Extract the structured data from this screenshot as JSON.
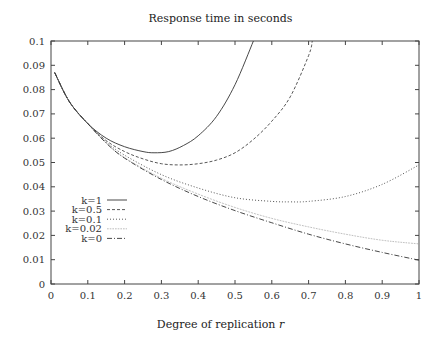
{
  "chart_data": {
    "type": "line",
    "title": "Response time in seconds",
    "xlabel": "Degree of replication r",
    "ylabel": "",
    "xlim": [
      0,
      1
    ],
    "ylim": [
      0,
      0.1
    ],
    "xticks": [
      "0",
      "0.1",
      "0.2",
      "0.3",
      "0.4",
      "0.5",
      "0.6",
      "0.7",
      "0.8",
      "0.9",
      "1"
    ],
    "yticks": [
      "0",
      "0.01",
      "0.02",
      "0.03",
      "0.04",
      "0.05",
      "0.06",
      "0.07",
      "0.08",
      "0.09",
      "0.1"
    ],
    "grid": false,
    "legend_position": "inside left, lower-middle",
    "series": [
      {
        "name": "k=1",
        "style": "solid",
        "x": [
          0.01,
          0.05,
          0.1,
          0.15,
          0.2,
          0.25,
          0.28,
          0.32,
          0.36,
          0.4,
          0.45,
          0.5,
          0.55
        ],
        "y": [
          0.087,
          0.075,
          0.066,
          0.06,
          0.0565,
          0.0545,
          0.054,
          0.0545,
          0.057,
          0.061,
          0.069,
          0.082,
          0.1
        ]
      },
      {
        "name": "k=0.5",
        "style": "dashed",
        "x": [
          0.01,
          0.05,
          0.1,
          0.15,
          0.2,
          0.25,
          0.3,
          0.35,
          0.4,
          0.45,
          0.5,
          0.55,
          0.6,
          0.65,
          0.7,
          0.71
        ],
        "y": [
          0.087,
          0.075,
          0.066,
          0.059,
          0.0545,
          0.0515,
          0.0495,
          0.049,
          0.0495,
          0.051,
          0.054,
          0.0595,
          0.067,
          0.077,
          0.094,
          0.1
        ]
      },
      {
        "name": "k=0.1",
        "style": "dotted",
        "x": [
          0.01,
          0.05,
          0.1,
          0.15,
          0.2,
          0.3,
          0.4,
          0.5,
          0.6,
          0.65,
          0.7,
          0.8,
          0.9,
          1.0
        ],
        "y": [
          0.087,
          0.075,
          0.066,
          0.0585,
          0.053,
          0.045,
          0.0395,
          0.0355,
          0.034,
          0.0338,
          0.034,
          0.036,
          0.041,
          0.049
        ]
      },
      {
        "name": "k=0.02",
        "style": "fine-dotted",
        "x": [
          0.01,
          0.05,
          0.1,
          0.15,
          0.2,
          0.3,
          0.4,
          0.5,
          0.6,
          0.7,
          0.8,
          0.9,
          1.0
        ],
        "y": [
          0.087,
          0.075,
          0.066,
          0.058,
          0.052,
          0.0435,
          0.037,
          0.0315,
          0.027,
          0.0235,
          0.0205,
          0.018,
          0.0165
        ]
      },
      {
        "name": "k=0",
        "style": "dash-dot",
        "x": [
          0.01,
          0.05,
          0.1,
          0.15,
          0.2,
          0.3,
          0.4,
          0.5,
          0.6,
          0.7,
          0.8,
          0.9,
          1.0
        ],
        "y": [
          0.087,
          0.075,
          0.066,
          0.058,
          0.0518,
          0.043,
          0.036,
          0.0302,
          0.0252,
          0.0205,
          0.0165,
          0.013,
          0.0098
        ]
      }
    ]
  }
}
